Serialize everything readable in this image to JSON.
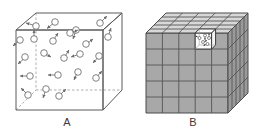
{
  "figure": {
    "title": "",
    "background_color": "#ffffff",
    "width": 264,
    "height": 138
  },
  "panels": [
    {
      "id": "A",
      "label": "A",
      "name": "continuum-gas-cube",
      "description": "Wireframe cube containing randomly distributed particles with velocity arrows",
      "style": {
        "edge_color": "#5a5a5a",
        "hidden_edge_color": "#9a9a9a",
        "particle_outline": "#6a6a6a",
        "particle_fill": "#ffffff",
        "arrow_color": "#6a6a6a",
        "fill": "none"
      },
      "particle_count": 22,
      "particles": [
        {
          "x": 36,
          "y": 26,
          "angle": 175
        },
        {
          "x": 55,
          "y": 22,
          "angle": 215
        },
        {
          "x": 76,
          "y": 30,
          "angle": 255
        },
        {
          "x": 100,
          "y": 23,
          "angle": 305
        },
        {
          "x": 20,
          "y": 40,
          "angle": 140
        },
        {
          "x": 34,
          "y": 39,
          "angle": 95
        },
        {
          "x": 53,
          "y": 41,
          "angle": 60
        },
        {
          "x": 70,
          "y": 33,
          "angle": 20
        },
        {
          "x": 86,
          "y": 44,
          "angle": 330
        },
        {
          "x": 108,
          "y": 37,
          "angle": 280
        },
        {
          "x": 25,
          "y": 57,
          "angle": 230
        },
        {
          "x": 44,
          "y": 53,
          "angle": 35
        },
        {
          "x": 64,
          "y": 58,
          "angle": 310
        },
        {
          "x": 80,
          "y": 54,
          "angle": 170
        },
        {
          "x": 99,
          "y": 56,
          "angle": 245
        },
        {
          "x": 30,
          "y": 76,
          "angle": 185
        },
        {
          "x": 58,
          "y": 75,
          "angle": 180
        },
        {
          "x": 78,
          "y": 72,
          "angle": 115
        },
        {
          "x": 96,
          "y": 78,
          "angle": 30
        },
        {
          "x": 28,
          "y": 95,
          "angle": 255
        },
        {
          "x": 46,
          "y": 89,
          "angle": 200
        },
        {
          "x": 59,
          "y": 96,
          "angle": 300
        }
      ]
    },
    {
      "id": "B",
      "label": "B",
      "name": "discretized-cell-cube",
      "description": "5 by 5 by 5 grid of shaded cubic cells with one highlighted white cell containing particles",
      "grid": {
        "nx": 5,
        "ny": 5,
        "nz": 5
      },
      "style": {
        "front_face_color": "#a8a8a8",
        "side_face_color": "#9a9a9a",
        "top_face_color": "#d8d8d8",
        "edge_color": "#4a4a4a",
        "grid_line_color": "#555555",
        "highlight_cell_color": "#ffffff",
        "highlight_edge_color": "#3a3a3a"
      },
      "highlighted_cell": {
        "column": 4,
        "row": 1,
        "label": "",
        "particle_count": 5
      }
    }
  ]
}
